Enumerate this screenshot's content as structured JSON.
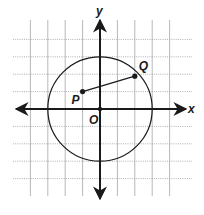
{
  "diagram": {
    "type": "coordinate-plane",
    "axes": {
      "x_label": "x",
      "y_label": "y",
      "origin_label": "O"
    },
    "grid": {
      "unit_px": 17.4,
      "origin_px": [
        100,
        109
      ],
      "x_range": [
        -5,
        5
      ],
      "y_range": [
        -4,
        4
      ],
      "style": "dotted"
    },
    "circle": {
      "center": [
        0,
        0
      ],
      "radius": 3
    },
    "points": [
      {
        "label": "P",
        "x": -1,
        "y": 1
      },
      {
        "label": "Q",
        "x": 2,
        "y": 2
      }
    ],
    "segments": [
      {
        "from": "P",
        "to": "Q"
      }
    ],
    "colors": {
      "line": "#1a1a1a",
      "grid": "#9a9a9a",
      "background": "#ffffff"
    }
  }
}
